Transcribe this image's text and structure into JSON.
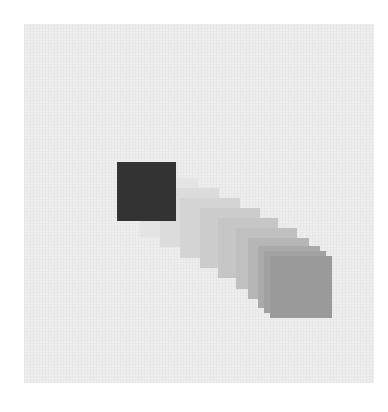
{
  "figure": {
    "background_color": "#eeeeee",
    "start_square": {
      "x": 117,
      "y": 162,
      "size": 59,
      "color": "#333333"
    },
    "end_square": {
      "x": 270,
      "y": 256,
      "size": 62,
      "color": "#9a9a9a"
    },
    "trail": [
      {
        "x": 140,
        "y": 178,
        "size": 59,
        "color": "#e4e4e4"
      },
      {
        "x": 160,
        "y": 188,
        "size": 59,
        "color": "#dcdcdc"
      },
      {
        "x": 180,
        "y": 198,
        "size": 60,
        "color": "#d4d4d4"
      },
      {
        "x": 200,
        "y": 208,
        "size": 60,
        "color": "#cccccc"
      },
      {
        "x": 218,
        "y": 218,
        "size": 60,
        "color": "#c6c6c6"
      },
      {
        "x": 236,
        "y": 228,
        "size": 61,
        "color": "#c0c0c0"
      },
      {
        "x": 248,
        "y": 238,
        "size": 61,
        "color": "#b6b6b6"
      },
      {
        "x": 258,
        "y": 246,
        "size": 62,
        "color": "#aaaaaa"
      },
      {
        "x": 264,
        "y": 251,
        "size": 62,
        "color": "#a2a2a2"
      }
    ]
  }
}
